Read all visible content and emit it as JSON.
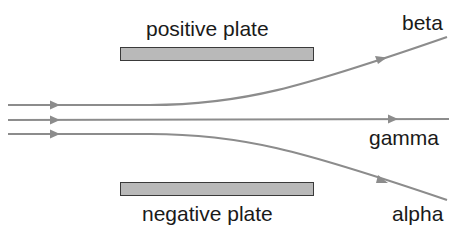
{
  "diagram": {
    "plates": [
      {
        "id": "positive",
        "label": "positive plate",
        "x": 120,
        "y": 47,
        "width": 194,
        "height": 14
      },
      {
        "id": "negative",
        "label": "negative plate",
        "x": 120,
        "y": 182,
        "width": 194,
        "height": 14
      }
    ],
    "rays": [
      {
        "id": "beta",
        "label": "beta",
        "deflection": "toward positive plate"
      },
      {
        "id": "gamma",
        "label": "gamma",
        "deflection": "undeflected"
      },
      {
        "id": "alpha",
        "label": "alpha",
        "deflection": "toward negative plate"
      }
    ],
    "colors": {
      "ray": "#8c8c8c",
      "plate_fill": "#b9b9b9",
      "plate_border": "#3a3a3a",
      "text": "#1a1a1a",
      "background": "#ffffff"
    }
  }
}
